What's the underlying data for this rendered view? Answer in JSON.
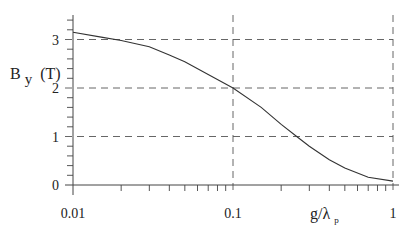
{
  "chart_data": {
    "type": "line",
    "title": "",
    "xlabel": "g/λp",
    "xlabel_main": "g/λ",
    "xlabel_sub": "p",
    "ylabel": "B y (T)",
    "ylabel_main": "B",
    "ylabel_sub": "y",
    "ylabel_unit": "(T)",
    "xscale": "log",
    "xlim": [
      0.01,
      1
    ],
    "ylim": [
      0,
      3.4
    ],
    "grid": "dashed at major ticks",
    "x_ticks": [
      {
        "value": 0.01,
        "label": "0.01"
      },
      {
        "value": 0.1,
        "label": "0.1"
      },
      {
        "value": 1,
        "label": "1"
      }
    ],
    "y_ticks": [
      {
        "value": 0,
        "label": "0"
      },
      {
        "value": 1,
        "label": "1"
      },
      {
        "value": 2,
        "label": "2"
      },
      {
        "value": 3,
        "label": "3"
      }
    ],
    "series": [
      {
        "name": "By",
        "x": [
          0.01,
          0.015,
          0.02,
          0.03,
          0.04,
          0.05,
          0.07,
          0.1,
          0.15,
          0.2,
          0.25,
          0.3,
          0.4,
          0.5,
          0.7,
          1.0
        ],
        "values": [
          3.15,
          3.05,
          2.98,
          2.85,
          2.68,
          2.54,
          2.28,
          2.0,
          1.6,
          1.25,
          1.0,
          0.8,
          0.52,
          0.35,
          0.16,
          0.08
        ]
      }
    ],
    "colors": {
      "line": "#333333",
      "axis": "#444444",
      "grid": "#555555"
    }
  }
}
